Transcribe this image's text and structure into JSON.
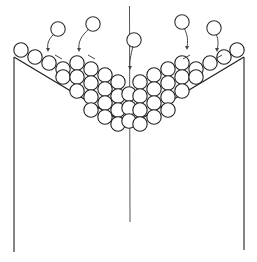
{
  "diagram": {
    "elements": {
      "left_wall": "left container wall",
      "right_wall": "right container wall",
      "center_partition": "central vertical partition",
      "left_slope": "left inclined floor",
      "right_slope": "right inclined floor",
      "packed_particles": "packed circular particles",
      "falling_particles": "falling particles with trajectory arrows"
    },
    "falling_particle_count": 5,
    "colors": {
      "line": "#222222",
      "background": "#ffffff"
    }
  }
}
